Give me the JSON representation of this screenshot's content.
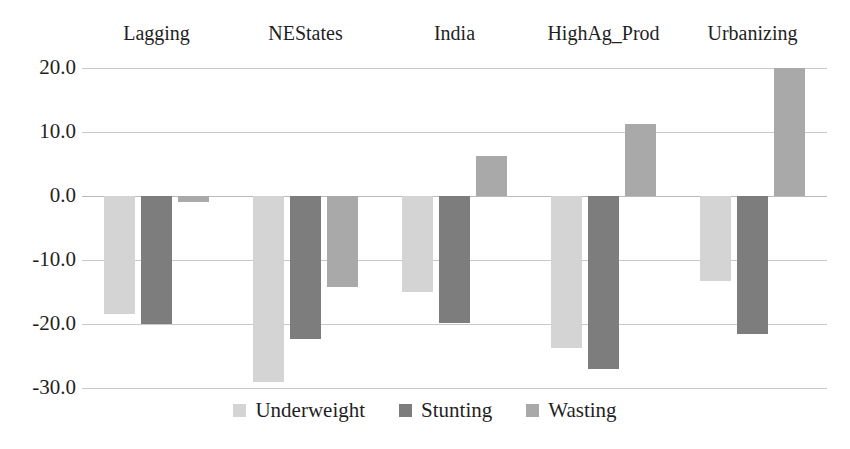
{
  "chart_data": {
    "type": "bar",
    "title": "",
    "subtitle": "",
    "xlabel": "",
    "ylabel": "",
    "ylim": [
      -30.0,
      20.0
    ],
    "yticks": [
      "20.0",
      "10.0",
      "0.0",
      "-10.0",
      "-20.0",
      "-30.0"
    ],
    "ytick_values": [
      20.0,
      10.0,
      0.0,
      -10.0,
      -20.0,
      -30.0
    ],
    "grid": true,
    "legend_position": "bottom",
    "categories": [
      "Lagging",
      "NEStates",
      "India",
      "HighAg_Prod",
      "Urbanizing"
    ],
    "series": [
      {
        "name": "Underweight",
        "color": "#d4d4d4",
        "values": [
          -18.5,
          -29.0,
          -15.0,
          -23.8,
          -13.3
        ]
      },
      {
        "name": "Stunting",
        "color": "#7d7d7d",
        "values": [
          -20.0,
          -22.3,
          -19.8,
          -27.0,
          -21.6
        ]
      },
      {
        "name": "Wasting",
        "color": "#a9a9a9",
        "values": [
          -1.0,
          -14.2,
          6.2,
          11.2,
          20.0
        ]
      }
    ]
  },
  "legend": {
    "items": [
      {
        "label": "Underweight"
      },
      {
        "label": "Stunting"
      },
      {
        "label": "Wasting"
      }
    ]
  }
}
